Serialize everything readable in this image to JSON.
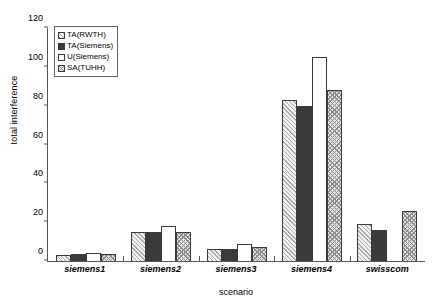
{
  "chart_data": {
    "type": "bar",
    "title": "",
    "xlabel": "scenario",
    "ylabel": "total interference",
    "ylim": [
      0,
      120
    ],
    "yticks": [
      0,
      20,
      40,
      60,
      80,
      100,
      120
    ],
    "grid": false,
    "legend_position": "upper-left-inside",
    "categories": [
      "siemens1",
      "siemens2",
      "siemens3",
      "siemens4",
      "swisscom"
    ],
    "series": [
      {
        "name": "TA(RWTH)",
        "pattern": "diagonal-hatch-light",
        "values": [
          3,
          15,
          6,
          83,
          19
        ]
      },
      {
        "name": "TA(Siemens)",
        "pattern": "solid-dark",
        "values": [
          3.5,
          15,
          6,
          80,
          16
        ]
      },
      {
        "name": "U(Siemens)",
        "pattern": "white-outline",
        "values": [
          4,
          18,
          9,
          105,
          0
        ]
      },
      {
        "name": "SA(TUHH)",
        "pattern": "cross-hatch-gray",
        "values": [
          3.5,
          15,
          7,
          88,
          26
        ]
      }
    ]
  },
  "legend": {
    "items": [
      {
        "label": "TA(RWTH)"
      },
      {
        "label": "TA(Siemens)"
      },
      {
        "label": "U(Siemens)"
      },
      {
        "label": "SA(TUHH)"
      }
    ]
  },
  "colors": {
    "axis": "#555555",
    "bar_border": "#3a3a3a",
    "ta_rwth": "#f2f2f2",
    "ta_siemens": "#3a3a3a",
    "u_siemens": "#ffffff",
    "sa_tuhh": "#e6e6e6"
  }
}
